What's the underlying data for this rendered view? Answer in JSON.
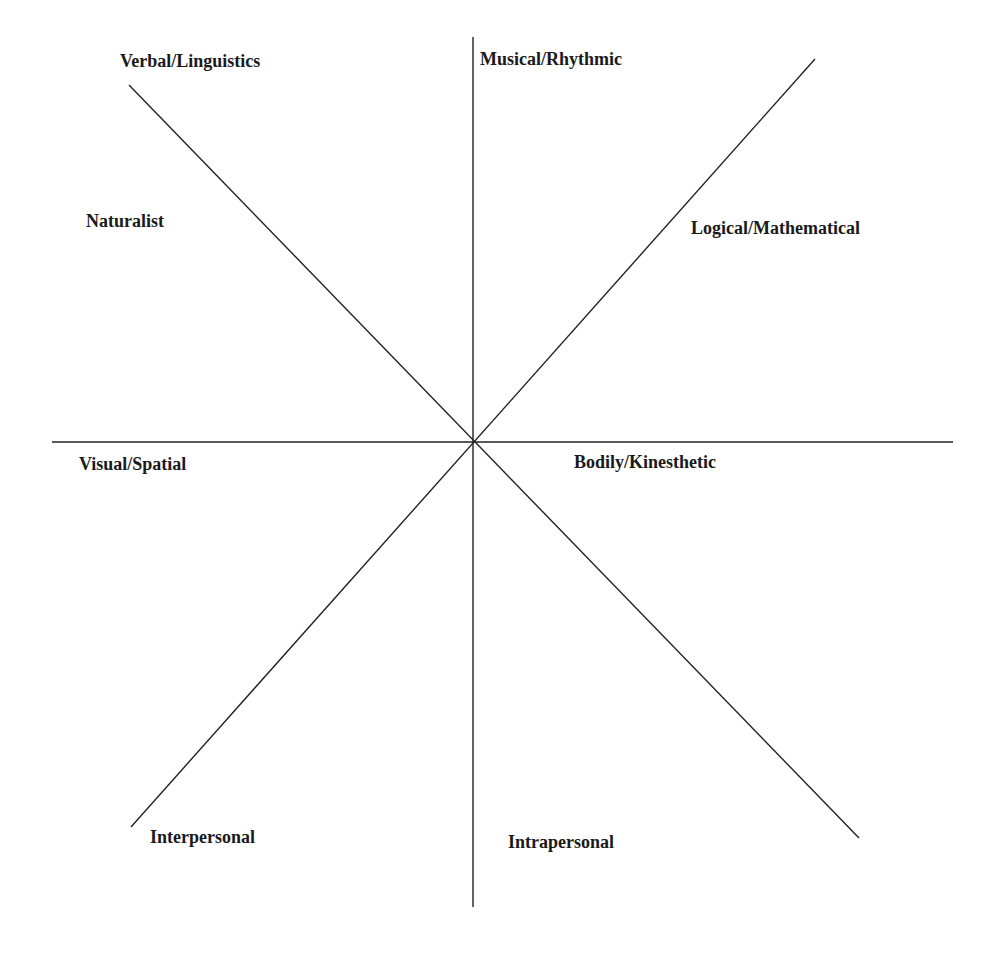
{
  "diagram": {
    "line_color": "#222222",
    "text_color": "#1a1a1a",
    "center": {
      "x": 473,
      "y": 442
    },
    "lines": [
      {
        "name": "vertical-axis",
        "x1": 473,
        "y1": 37,
        "x2": 473,
        "y2": 907
      },
      {
        "name": "horizontal-axis",
        "x1": 52,
        "y1": 442,
        "x2": 953,
        "y2": 442
      },
      {
        "name": "diagonal-topleft-bottomright",
        "x1": 129,
        "y1": 85,
        "x2": 859,
        "y2": 838
      },
      {
        "name": "diagonal-topright-bottomleft",
        "x1": 815,
        "y1": 59,
        "x2": 131,
        "y2": 827
      }
    ],
    "labels": [
      {
        "id": "verbal",
        "text": "Verbal/Linguistics",
        "x": 120,
        "y": 52
      },
      {
        "id": "musical",
        "text": "Musical/Rhythmic",
        "x": 480,
        "y": 50
      },
      {
        "id": "naturalist",
        "text": "Naturalist",
        "x": 86,
        "y": 212
      },
      {
        "id": "logical",
        "text": "Logical/Mathematical",
        "x": 691,
        "y": 219
      },
      {
        "id": "visual",
        "text": "Visual/Spatial",
        "x": 79,
        "y": 455
      },
      {
        "id": "bodily",
        "text": "Bodily/Kinesthetic",
        "x": 574,
        "y": 453
      },
      {
        "id": "interpersonal",
        "text": "Interpersonal",
        "x": 150,
        "y": 828
      },
      {
        "id": "intrapersonal",
        "text": "Intrapersonal",
        "x": 508,
        "y": 833
      }
    ]
  }
}
